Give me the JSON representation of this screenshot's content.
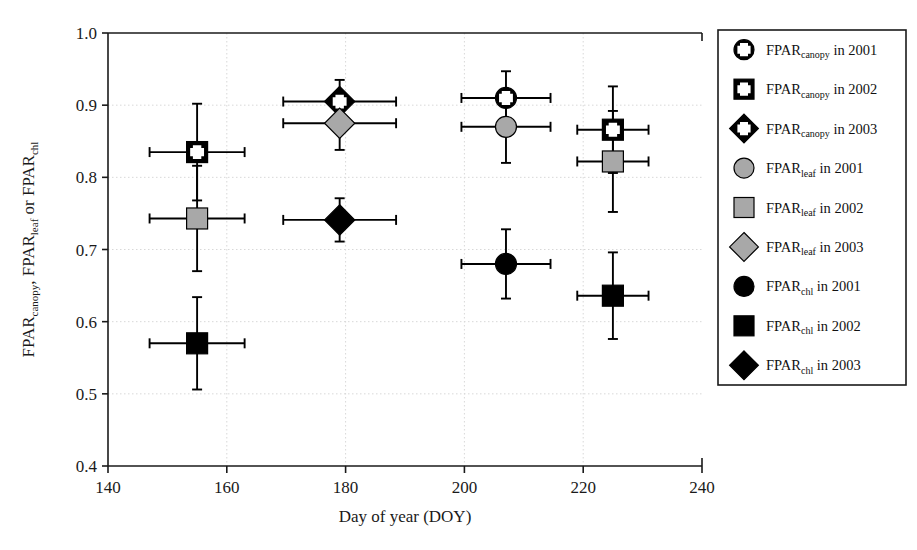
{
  "chart_data": {
    "type": "scatter",
    "title": "",
    "xlabel": "Day of year (DOY)",
    "ylabel_parts": [
      {
        "base": "FPAR",
        "sub": "canopy",
        "tail": ", "
      },
      {
        "base": "FPAR",
        "sub": "leaf",
        "tail": " or "
      },
      {
        "base": "FPAR",
        "sub": "chl",
        "tail": ""
      }
    ],
    "ylabel_plain": "FPARcanopy, FPARleaf or FPARchl",
    "xlim": [
      140,
      240
    ],
    "ylim": [
      0.4,
      1.0
    ],
    "xticks": [
      140,
      160,
      180,
      200,
      220,
      240
    ],
    "ytick_labels": [
      "0.4",
      "0.5",
      "0.6",
      "0.7",
      "0.8",
      "0.9",
      "1.0"
    ],
    "yticks": [
      0.4,
      0.5,
      0.6,
      0.7,
      0.8,
      0.9,
      1.0
    ],
    "grid": true,
    "grid_style": "dotted",
    "legend_position": "outside-right",
    "colors": {
      "black": "#000000",
      "gray": "#a8a8a8",
      "axis": "#1a1a1a",
      "grid": "#d8d8d8"
    },
    "series": [
      {
        "name": "FPARcanopy in 2001",
        "label_base": "FPAR",
        "label_sub": "canopy",
        "label_tail": " in 2001",
        "marker": "circle",
        "fill": "#000000",
        "plus": true,
        "points": [
          {
            "x": 207,
            "y": 0.91,
            "yerr": 0.037,
            "xerr": 7.5
          }
        ]
      },
      {
        "name": "FPARcanopy in 2002",
        "label_base": "FPAR",
        "label_sub": "canopy",
        "label_tail": " in 2002",
        "marker": "square",
        "fill": "#000000",
        "plus": true,
        "points": [
          {
            "x": 155,
            "y": 0.835,
            "yerr": 0.067,
            "xerr": 8.0
          },
          {
            "x": 225,
            "y": 0.866,
            "yerr": 0.06,
            "xerr": 6.0
          }
        ]
      },
      {
        "name": "FPARcanopy in 2003",
        "label_base": "FPAR",
        "label_sub": "canopy",
        "label_tail": " in 2003",
        "marker": "diamond",
        "fill": "#000000",
        "plus": true,
        "points": [
          {
            "x": 179,
            "y": 0.905,
            "yerr": 0.03,
            "xerr": 9.5
          }
        ]
      },
      {
        "name": "FPARleaf in 2001",
        "label_base": "FPAR",
        "label_sub": "leaf",
        "label_tail": " in 2001",
        "marker": "circle",
        "fill": "#a8a8a8",
        "plus": false,
        "points": [
          {
            "x": 207,
            "y": 0.87,
            "yerr": 0.05,
            "xerr": 7.5
          }
        ]
      },
      {
        "name": "FPARleaf in 2002",
        "label_base": "FPAR",
        "label_sub": "leaf",
        "label_tail": " in 2002",
        "marker": "square",
        "fill": "#a8a8a8",
        "plus": false,
        "points": [
          {
            "x": 155,
            "y": 0.743,
            "yerr": 0.073,
            "xerr": 8.0
          },
          {
            "x": 225,
            "y": 0.822,
            "yerr": 0.07,
            "xerr": 6.0
          }
        ]
      },
      {
        "name": "FPARleaf in 2003",
        "label_base": "FPAR",
        "label_sub": "leaf",
        "label_tail": " in 2003",
        "marker": "diamond",
        "fill": "#a8a8a8",
        "plus": false,
        "points": [
          {
            "x": 179,
            "y": 0.875,
            "yerr": 0.037,
            "xerr": 9.5
          }
        ]
      },
      {
        "name": "FPARchl in 2001",
        "label_base": "FPAR",
        "label_sub": "chl",
        "label_tail": " in 2001",
        "marker": "circle",
        "fill": "#000000",
        "plus": false,
        "points": [
          {
            "x": 207,
            "y": 0.68,
            "yerr": 0.048,
            "xerr": 7.5
          }
        ]
      },
      {
        "name": "FPARchl in 2002",
        "label_base": "FPAR",
        "label_sub": "chl",
        "label_tail": " in 2002",
        "marker": "square",
        "fill": "#000000",
        "plus": false,
        "points": [
          {
            "x": 155,
            "y": 0.57,
            "yerr": 0.064,
            "xerr": 8.0
          },
          {
            "x": 225,
            "y": 0.636,
            "yerr": 0.06,
            "xerr": 6.0
          }
        ]
      },
      {
        "name": "FPARchl in 2003",
        "label_base": "FPAR",
        "label_sub": "chl",
        "label_tail": " in 2003",
        "marker": "diamond",
        "fill": "#000000",
        "plus": false,
        "points": [
          {
            "x": 179,
            "y": 0.741,
            "yerr": 0.03,
            "xerr": 9.5
          }
        ]
      }
    ]
  }
}
